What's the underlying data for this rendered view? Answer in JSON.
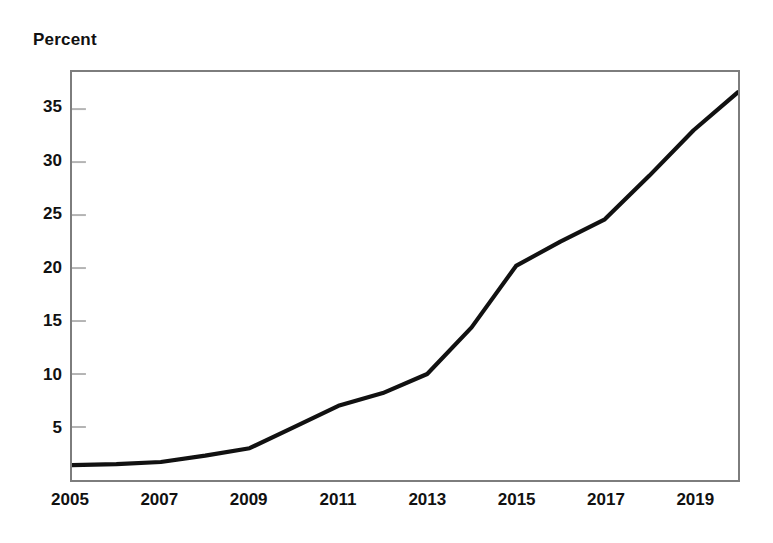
{
  "chart_data": {
    "type": "line",
    "title": "",
    "subtitle": "",
    "ylabel": "Percent",
    "xlabel": "",
    "legend": [],
    "grid": false,
    "ylim": [
      0,
      38.5
    ],
    "xlim": [
      2005,
      2020
    ],
    "ytick_labels": [
      "5",
      "10",
      "15",
      "20",
      "25",
      "30",
      "35"
    ],
    "ytick_values": [
      5,
      10,
      15,
      20,
      25,
      30,
      35
    ],
    "xtick_labels": [
      "2005",
      "2007",
      "2009",
      "2011",
      "2013",
      "2015",
      "2017",
      "2019"
    ],
    "xtick_values": [
      2005,
      2007,
      2009,
      2011,
      2013,
      2015,
      2017,
      2019
    ],
    "x": [
      2005,
      2006,
      2007,
      2008,
      2009,
      2010,
      2011,
      2012,
      2013,
      2014,
      2015,
      2016,
      2017,
      2018,
      2019,
      2020
    ],
    "values": [
      1.4,
      1.5,
      1.7,
      2.3,
      3.0,
      5.0,
      7.0,
      8.2,
      10.0,
      14.4,
      20.2,
      22.5,
      24.6,
      28.7,
      33.0,
      36.6
    ],
    "series": [
      {
        "name": "Percent",
        "color": "#111111",
        "values": [
          1.4,
          1.5,
          1.7,
          2.3,
          3.0,
          5.0,
          7.0,
          8.2,
          10.0,
          14.4,
          20.2,
          22.5,
          24.6,
          28.7,
          33.0,
          36.6
        ]
      }
    ],
    "line_color": "#111111",
    "frame_color": "#7d7d7d",
    "tick_color": "#b4b4b4",
    "background": "#ffffff"
  }
}
